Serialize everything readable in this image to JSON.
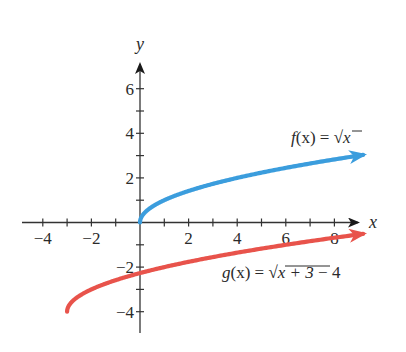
{
  "chart_data": {
    "type": "line",
    "title": "",
    "xlabel": "x",
    "ylabel": "y",
    "xlim": [
      -4.2,
      9.2
    ],
    "ylim": [
      -5,
      7
    ],
    "grid": false,
    "legend_position": "inline labels",
    "x_ticks": [
      -4,
      -3,
      -2,
      -1,
      1,
      2,
      3,
      4,
      5,
      6,
      7,
      8
    ],
    "x_tick_labels": [
      "−4",
      "−2",
      "2",
      "4",
      "6",
      "8"
    ],
    "x_tick_label_values": [
      -4,
      -2,
      2,
      4,
      6,
      8
    ],
    "y_ticks": [
      -4,
      -3,
      -2,
      -1,
      1,
      2,
      3,
      4,
      5,
      6
    ],
    "y_tick_labels": [
      "6",
      "4",
      "2",
      "−2",
      "−4"
    ],
    "y_tick_label_values": [
      6,
      4,
      2,
      -2,
      -4
    ],
    "series": [
      {
        "name": "f(x) = √x",
        "label_parts": {
          "fn": "f",
          "arg": "(x)",
          "eq": " = ",
          "rad": "√",
          "radicand": "x",
          "tail": ""
        },
        "color": "#3b9ddd",
        "domain": [
          0,
          9.18
        ],
        "arrow_end": true,
        "x": [
          0,
          0.25,
          1,
          2,
          3,
          4,
          5,
          6,
          7,
          8,
          9.18
        ],
        "y": [
          0,
          0.5,
          1,
          1.41,
          1.73,
          2,
          2.24,
          2.45,
          2.65,
          2.83,
          3.03
        ]
      },
      {
        "name": "g(x) = √(x + 3) − 4",
        "label_parts": {
          "fn": "g",
          "arg": "(x)",
          "eq": " = ",
          "rad": "√",
          "radicand": "x + 3",
          "tail": " − 4"
        },
        "color": "#e8534b",
        "domain": [
          -3,
          9.18
        ],
        "arrow_end": true,
        "x": [
          -3,
          -2.75,
          -2,
          -1,
          0,
          1,
          2,
          3,
          4,
          5,
          6,
          7,
          8,
          9.18
        ],
        "y": [
          -4,
          -3.5,
          -3,
          -2.59,
          -2.27,
          -2,
          -1.76,
          -1.55,
          -1.35,
          -1.17,
          -1,
          -0.84,
          -0.68,
          -0.51
        ]
      }
    ],
    "annotations": [
      {
        "text": "f(x) = √x",
        "near": [
          7.5,
          4
        ]
      },
      {
        "text": "g(x) = √(x + 3) − 4",
        "near": [
          6,
          -2.3
        ]
      }
    ]
  },
  "axes": {
    "x_name": "x",
    "y_name": "y"
  }
}
